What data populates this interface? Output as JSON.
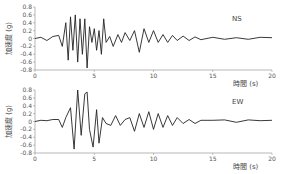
{
  "chart_data": [
    {
      "type": "line",
      "title": "",
      "component_label": "NS",
      "xlabel": "時間 (s)",
      "ylabel": "加速度 (g)",
      "xlim": [
        0,
        20
      ],
      "ylim": [
        -0.8,
        0.8
      ],
      "xticks": [
        0,
        5,
        10,
        15,
        20
      ],
      "yticks": [
        0.8,
        0.6,
        0.4,
        0.2,
        0,
        -0.2,
        -0.4,
        -0.6,
        -0.8
      ],
      "x": [
        0,
        0.5,
        1,
        1.5,
        2,
        2.3,
        2.6,
        2.8,
        3.0,
        3.2,
        3.4,
        3.6,
        3.8,
        4.0,
        4.2,
        4.4,
        4.6,
        4.8,
        5.0,
        5.2,
        5.4,
        5.6,
        5.8,
        6.0,
        6.3,
        6.6,
        7.0,
        7.3,
        7.6,
        8.0,
        8.4,
        8.8,
        9.2,
        9.6,
        10.0,
        10.4,
        10.8,
        11.2,
        11.6,
        12,
        12.5,
        13,
        13.5,
        14,
        15,
        16,
        17,
        18,
        19,
        20
      ],
      "values": [
        0,
        0.03,
        -0.05,
        0.05,
        0.08,
        -0.2,
        0.4,
        -0.55,
        0.55,
        -0.3,
        0.6,
        -0.6,
        0.5,
        -0.4,
        0.5,
        -0.75,
        0.3,
        -0.1,
        0.25,
        -0.3,
        0.2,
        -0.4,
        0.5,
        -0.1,
        0.05,
        -0.2,
        0.1,
        -0.1,
        0.15,
        -0.05,
        0.2,
        -0.35,
        0.25,
        -0.1,
        0.2,
        -0.1,
        0.1,
        -0.1,
        0.08,
        -0.05,
        0.06,
        -0.05,
        0.04,
        -0.03,
        0.03,
        -0.02,
        0.02,
        -0.02,
        0.03,
        0.02
      ]
    },
    {
      "type": "line",
      "title": "",
      "component_label": "EW",
      "xlabel": "時間 (s)",
      "ylabel": "加速度 (g)",
      "xlim": [
        0,
        20
      ],
      "ylim": [
        -0.8,
        0.8
      ],
      "xticks": [
        0,
        5,
        10,
        15,
        20
      ],
      "yticks": [
        0.8,
        0.6,
        0.4,
        0.2,
        0,
        -0.2,
        -0.4,
        -0.6,
        -0.8
      ],
      "x": [
        0,
        0.5,
        1,
        1.5,
        2,
        2.3,
        2.6,
        3.0,
        3.3,
        3.6,
        3.9,
        4.2,
        4.4,
        4.6,
        4.9,
        5.2,
        5.4,
        5.7,
        6.0,
        6.4,
        6.8,
        7.2,
        7.6,
        8.0,
        8.4,
        8.8,
        9.2,
        9.6,
        10,
        10.4,
        10.8,
        11.2,
        11.6,
        12,
        12.5,
        13,
        13.5,
        14,
        15,
        16,
        17,
        18,
        19,
        20
      ],
      "values": [
        0,
        0.03,
        0.02,
        0.05,
        0.05,
        -0.15,
        0.1,
        0.35,
        -0.7,
        0.8,
        -0.35,
        0.7,
        0.75,
        -0.2,
        -0.65,
        0.3,
        -0.55,
        0.1,
        -0.05,
        -0.1,
        0.15,
        -0.1,
        0.05,
        0.1,
        -0.25,
        0.2,
        -0.15,
        0.25,
        -0.2,
        0.2,
        -0.15,
        0.15,
        -0.1,
        0.1,
        -0.05,
        0.05,
        -0.05,
        0.03,
        0.03,
        0.04,
        -0.02,
        0.04,
        0.02,
        0.03
      ]
    }
  ]
}
